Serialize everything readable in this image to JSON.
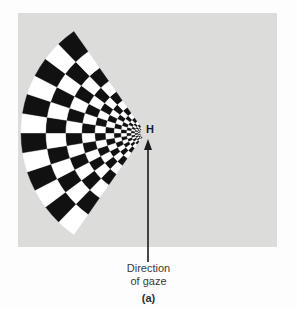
{
  "figure": {
    "panel_letter": "(a)",
    "background_color": "#dcdcdb",
    "page_color": "#fdfdfd",
    "checker_dark": "#111111",
    "checker_light": "#ffffff"
  },
  "labels": {
    "fixation_point": "H",
    "caption_line_1": "Direction",
    "caption_line_2": "of gaze"
  },
  "icons": {
    "gaze_arrow": "arrow-up-icon"
  },
  "chart_data": {
    "type": "scatter",
    "title": "",
    "xlabel": "",
    "ylabel": "",
    "apex": {
      "x": 145,
      "y": 133
    },
    "start_angle_deg": 125,
    "end_angle_deg": 235,
    "inner_radius": 5,
    "outer_radius": 124,
    "radial_rings": 12,
    "angular_sectors": 12,
    "ring_growth": 1.235,
    "annotations": [
      {
        "text": "H",
        "x": 150,
        "y": 130
      },
      {
        "text": "Direction",
        "x": 148,
        "y": 268
      },
      {
        "text": "of gaze",
        "x": 148,
        "y": 281
      },
      {
        "text": "(a)",
        "x": 148,
        "y": 298
      }
    ],
    "arrow": {
      "x": 148,
      "y_tail": 262,
      "y_head": 142
    }
  }
}
